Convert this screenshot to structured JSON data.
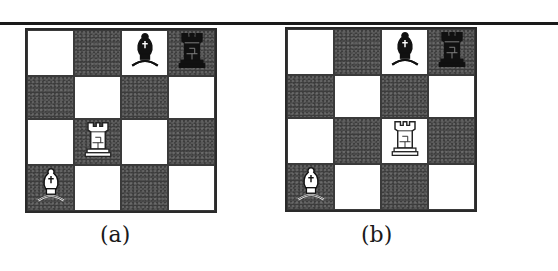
{
  "figure": {
    "boards": [
      {
        "id": "a",
        "caption": "(a)",
        "size": 4,
        "pieces": [
          {
            "type": "bishop",
            "color": "black",
            "row": 0,
            "col": 2
          },
          {
            "type": "rook",
            "color": "black",
            "row": 0,
            "col": 3
          },
          {
            "type": "rook",
            "color": "white",
            "row": 2,
            "col": 1
          },
          {
            "type": "bishop",
            "color": "white",
            "row": 3,
            "col": 0
          }
        ]
      },
      {
        "id": "b",
        "caption": "(b)",
        "size": 4,
        "pieces": [
          {
            "type": "bishop",
            "color": "black",
            "row": 0,
            "col": 2
          },
          {
            "type": "rook",
            "color": "black",
            "row": 0,
            "col": 3
          },
          {
            "type": "rook",
            "color": "white",
            "row": 2,
            "col": 2
          },
          {
            "type": "bishop",
            "color": "white",
            "row": 3,
            "col": 0
          }
        ]
      }
    ]
  }
}
